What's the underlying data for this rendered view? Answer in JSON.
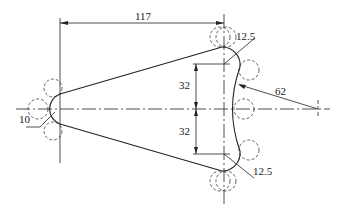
{
  "drawing": {
    "type": "engineering-drawing",
    "description": "Plate outline: small arc R10 on left joined by two tangent lines to a right-hand profile of two R12.5 fillets and a concave R62 arc",
    "line_color": "#222222",
    "background": "#ffffff",
    "dimensions": {
      "horizontal_length": "117",
      "upper_half_height": "32",
      "lower_half_height": "32",
      "left_radius": "10",
      "upper_fillet_radius": "12.5",
      "lower_fillet_radius": "12.5",
      "large_arc_radius": "62"
    }
  }
}
